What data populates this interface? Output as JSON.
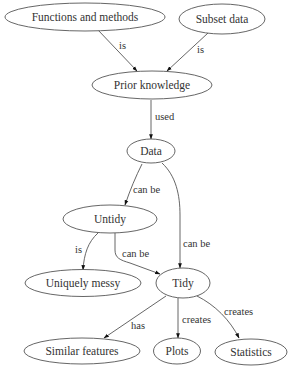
{
  "diagram": {
    "type": "concept-map",
    "nodes": {
      "functions": {
        "label": "Functions and methods"
      },
      "subset": {
        "label": "Subset data"
      },
      "prior": {
        "label": "Prior knowledge"
      },
      "data": {
        "label": "Data"
      },
      "untidy": {
        "label": "Untidy"
      },
      "messy": {
        "label": "Uniquely messy"
      },
      "tidy": {
        "label": "Tidy"
      },
      "similar": {
        "label": "Similar features"
      },
      "plots": {
        "label": "Plots"
      },
      "statistics": {
        "label": "Statistics"
      }
    },
    "edges": {
      "functions_prior": {
        "from": "Functions and methods",
        "to": "Prior knowledge",
        "label": "is"
      },
      "subset_prior": {
        "from": "Subset data",
        "to": "Prior knowledge",
        "label": "is"
      },
      "prior_data": {
        "from": "Prior knowledge",
        "to": "Data",
        "label": "used"
      },
      "data_untidy": {
        "from": "Data",
        "to": "Untidy",
        "label": "can be"
      },
      "data_tidy": {
        "from": "Data",
        "to": "Tidy",
        "label": "can be"
      },
      "untidy_messy": {
        "from": "Untidy",
        "to": "Uniquely messy",
        "label": "is"
      },
      "untidy_tidy": {
        "from": "Untidy",
        "to": "Tidy",
        "label": "can be"
      },
      "tidy_similar": {
        "from": "Tidy",
        "to": "Similar features",
        "label": "has"
      },
      "tidy_plots": {
        "from": "Tidy",
        "to": "Plots",
        "label": "creates"
      },
      "tidy_statistics": {
        "from": "Tidy",
        "to": "Statistics",
        "label": "creates"
      }
    },
    "colors": {
      "stroke": "#555555",
      "text": "#333333",
      "arrowhead": "#111111",
      "background": "#ffffff"
    }
  }
}
